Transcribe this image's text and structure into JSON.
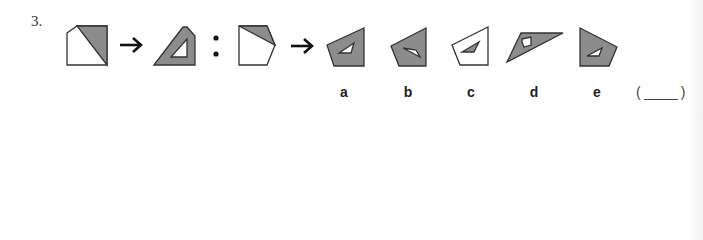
{
  "question": {
    "number": "3.",
    "colors": {
      "fill": "#8c8c8c",
      "stroke": "#333333",
      "white": "#ffffff"
    }
  },
  "options": [
    {
      "label": "a"
    },
    {
      "label": "b"
    },
    {
      "label": "c"
    },
    {
      "label": "d"
    },
    {
      "label": "e"
    }
  ],
  "answer": {
    "open": "(",
    "close": ")"
  },
  "symbols": {
    "arrow": "arrow-right",
    "separator": "colon"
  }
}
